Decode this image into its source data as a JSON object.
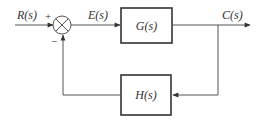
{
  "diagram": {
    "type": "feedback-control-block-diagram",
    "signals": {
      "input": "R(s)",
      "error": "E(s)",
      "output": "C(s)"
    },
    "blocks": {
      "forward": "G(s)",
      "feedback": "H(s)"
    },
    "summing_junction": {
      "plus_sign": "+",
      "minus_sign": "−"
    },
    "colors": {
      "line": "#555555",
      "block_border": "#333333",
      "background": "#ffffff"
    }
  }
}
